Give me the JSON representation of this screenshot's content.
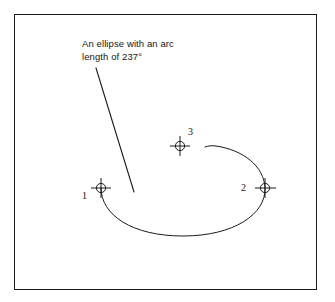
{
  "figure": {
    "background_color": "#ffffff",
    "line_color": "#1a1a1a",
    "frame": {
      "x": 14,
      "y": 14,
      "width": 303,
      "height": 276
    }
  },
  "annotation": {
    "line1": "An ellipse with an arc",
    "line2": "length of 237°",
    "arc_length_degrees": "237",
    "leader": {
      "from_x": 96,
      "from_y": 68,
      "to_x": 134,
      "to_y": 192
    }
  },
  "points": [
    {
      "id": "1",
      "label": "1",
      "marker": "crosshair-circle-icon",
      "x": 101,
      "y": 188,
      "role": "arc-start"
    },
    {
      "id": "2",
      "label": "2",
      "marker": "crosshair-circle-icon",
      "x": 265,
      "y": 188,
      "role": "arc-through"
    },
    {
      "id": "3",
      "label": "3",
      "marker": "crosshair-circle-icon",
      "x": 180,
      "y": 146,
      "role": "center-reference"
    }
  ],
  "arc": {
    "type": "elliptical-arc",
    "sweep_degrees": "237",
    "start_x": 101,
    "start_y": 188,
    "bottom_x": 183,
    "bottom_y": 236,
    "right_x": 265,
    "right_y": 188,
    "end_x": 205,
    "end_y": 147
  }
}
